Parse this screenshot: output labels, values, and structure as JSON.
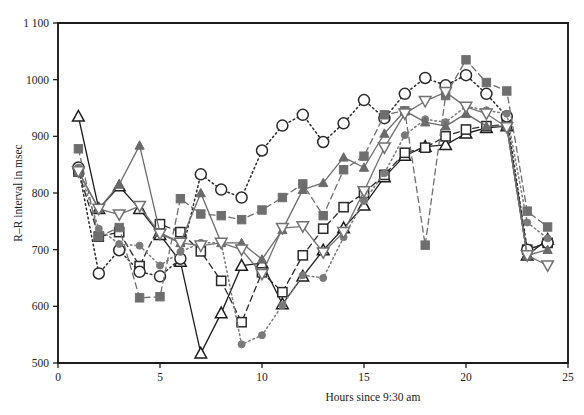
{
  "chart_data": {
    "type": "line",
    "title": "",
    "xlabel": "Hours since 9:30 am",
    "ylabel": "R–R interval in msec",
    "xlim": [
      0,
      25
    ],
    "ylim": [
      500,
      1100
    ],
    "xticks": [
      0,
      5,
      10,
      15,
      20,
      25
    ],
    "xtick_labels": [
      "0",
      "5",
      "10",
      "15",
      "20",
      "25"
    ],
    "yticks": [
      500,
      600,
      700,
      800,
      900,
      1000,
      1100
    ],
    "ytick_labels": [
      "500",
      "600",
      "700",
      "800",
      "900",
      "1000",
      "1 100"
    ],
    "grid": false,
    "legend": "none",
    "x": [
      1,
      2,
      3,
      4,
      5,
      6,
      7,
      8,
      9,
      10,
      11,
      12,
      13,
      14,
      15,
      16,
      17,
      18,
      19,
      20,
      21,
      22,
      23,
      24
    ],
    "series": [
      {
        "name": "subject-1",
        "marker": "open-triangle-up",
        "line_style": "solid",
        "color": "#1d1d1d",
        "values": [
          935,
          772,
          812,
          772,
          726,
          679,
          517,
          588,
          672,
          676,
          604,
          653,
          699,
          738,
          778,
          828,
          866,
          882,
          885,
          905,
          915,
          918,
          690,
          718
        ]
      },
      {
        "name": "subject-2",
        "marker": "open-square",
        "line_style": "dashed",
        "color": "#2a2a2a",
        "values": [
          838,
          723,
          731,
          671,
          745,
          731,
          697,
          645,
          572,
          660,
          625,
          690,
          737,
          775,
          800,
          832,
          871,
          880,
          900,
          912,
          918,
          921,
          700,
          712
        ]
      },
      {
        "name": "subject-3",
        "marker": "open-circle",
        "line_style": "dotted",
        "color": "#2a2a2a",
        "values": [
          845,
          658,
          699,
          661,
          653,
          684,
          833,
          806,
          792,
          875,
          919,
          938,
          890,
          923,
          964,
          932,
          975,
          1003,
          990,
          1008,
          975,
          935,
          700,
          712
        ]
      },
      {
        "name": "subject-4",
        "marker": "filled-square",
        "line_style": "dashed",
        "color": "#6e6e6e",
        "values": [
          878,
          723,
          739,
          615,
          617,
          790,
          763,
          760,
          753,
          770,
          792,
          816,
          760,
          841,
          865,
          938,
          945,
          708,
          972,
          1035,
          995,
          980,
          768,
          740
        ]
      },
      {
        "name": "subject-5",
        "marker": "filled-circle",
        "line_style": "dotted",
        "color": "#7a7a7a",
        "values": [
          845,
          737,
          710,
          707,
          672,
          696,
          712,
          712,
          533,
          549,
          602,
          655,
          650,
          722,
          786,
          835,
          902,
          930,
          925,
          953,
          946,
          940,
          748,
          720
        ]
      },
      {
        "name": "subject-6",
        "marker": "filled-triangle-up",
        "line_style": "solid",
        "color": "#6a6a6a",
        "values": [
          838,
          772,
          815,
          884,
          730,
          712,
          800,
          712,
          712,
          683,
          735,
          806,
          818,
          863,
          845,
          905,
          945,
          925,
          918,
          940,
          918,
          918,
          690,
          700
        ]
      },
      {
        "name": "subject-7",
        "marker": "open-triangle-down",
        "line_style": "solid",
        "color": "#717171",
        "values": [
          838,
          772,
          762,
          777,
          728,
          712,
          707,
          712,
          700,
          657,
          738,
          741,
          695,
          731,
          803,
          880,
          940,
          962,
          978,
          952,
          940,
          916,
          690,
          672
        ]
      }
    ]
  }
}
